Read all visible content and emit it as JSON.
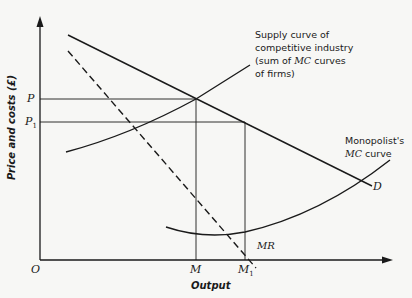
{
  "diagram": {
    "axes": {
      "y_label": "Price and costs (£)",
      "x_label": "Output",
      "origin": "O"
    },
    "y_ticks": [
      {
        "label": "P",
        "sub": ""
      },
      {
        "label": "P",
        "sub": "1"
      }
    ],
    "x_ticks": [
      {
        "label": "M",
        "sub": ""
      },
      {
        "label": "M",
        "sub": "1"
      }
    ],
    "curves": {
      "demand": {
        "label": "D"
      },
      "marginal_revenue": {
        "label": "MR",
        "style": "dashed"
      },
      "supply": {
        "label_line1": "Supply curve of",
        "label_line2": "competitive industry",
        "label_line3_pre": "(sum of ",
        "label_line3_it": "MC",
        "label_line3_post": " curves",
        "label_line4": "of firms)"
      },
      "monopolist_mc": {
        "label_line1": "Monopolist's",
        "label_line2_it": "MC",
        "label_line2_post": " curve"
      }
    },
    "colors": {
      "line": "#1a1a1a",
      "background": "#f7f7f5"
    }
  }
}
